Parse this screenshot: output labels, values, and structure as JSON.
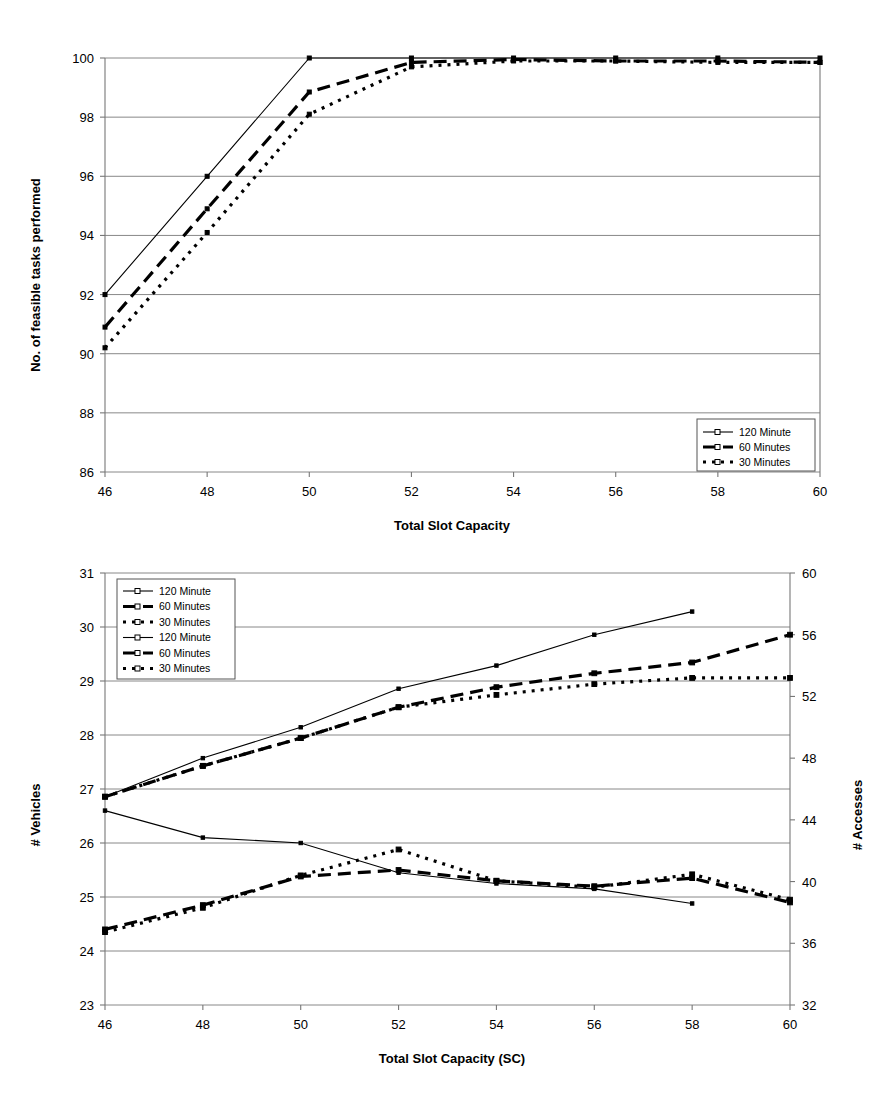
{
  "document": {
    "type": "two-panel line chart figure",
    "background_color": "#ffffff",
    "ink_color": "#000000",
    "grid_color": "#888888"
  },
  "chart_data": [
    {
      "id": "chart-top",
      "type": "line",
      "title": "",
      "xlabel": "Total Slot Capacity",
      "ylabel": "No. of feasible tasks performed",
      "xlim": [
        46,
        60
      ],
      "ylim": [
        86,
        100
      ],
      "xticks": [
        46,
        48,
        50,
        52,
        54,
        56,
        58,
        60
      ],
      "yticks": [
        86,
        88,
        90,
        92,
        94,
        96,
        98,
        100
      ],
      "grid": "horizontal",
      "legend_position": "bottom-right",
      "x": [
        46,
        48,
        50,
        52,
        54,
        56,
        58,
        60
      ],
      "series": [
        {
          "name": "120 Minute",
          "style": "solid-thin",
          "marker": "open-diamond",
          "values": [
            92.0,
            96.0,
            100.0,
            100.0,
            100.0,
            100.0,
            100.0,
            100.0
          ]
        },
        {
          "name": "60 Minutes",
          "style": "thick-dashed",
          "marker": "open-square",
          "values": [
            90.9,
            94.9,
            98.85,
            99.85,
            99.95,
            99.9,
            99.9,
            99.85
          ]
        },
        {
          "name": "30 Minutes",
          "style": "dotted",
          "marker": "open-triangle",
          "values": [
            90.2,
            94.1,
            98.1,
            99.7,
            99.9,
            99.9,
            99.85,
            99.85
          ]
        }
      ]
    },
    {
      "id": "chart-bottom",
      "type": "line",
      "title": "",
      "xlabel": "Total Slot Capacity (SC)",
      "ylabel_left": "# Vehicles",
      "ylabel_right": "# Accesses",
      "xlim": [
        46,
        60
      ],
      "ylim_left": [
        23,
        31
      ],
      "ylim_right": [
        32,
        60
      ],
      "xticks": [
        46,
        48,
        50,
        52,
        54,
        56,
        58,
        60
      ],
      "yticks_left": [
        23,
        24,
        25,
        26,
        27,
        28,
        29,
        30,
        31
      ],
      "yticks_right": [
        32,
        36,
        40,
        44,
        48,
        52,
        56,
        60
      ],
      "grid": "horizontal",
      "legend_position": "top-left",
      "x": [
        46,
        48,
        50,
        52,
        54,
        56,
        58,
        60
      ],
      "series": [
        {
          "name": "120 Minute",
          "axis": "right",
          "group": "accesses",
          "style": "solid-thin",
          "marker": "open-diamond",
          "values": [
            45.5,
            48.0,
            50.0,
            52.5,
            54.0,
            56.0,
            57.5,
            null
          ]
        },
        {
          "name": "60 Minutes",
          "axis": "right",
          "group": "accesses",
          "style": "thick-dashed",
          "marker": "open-square",
          "values": [
            45.5,
            47.5,
            49.3,
            51.3,
            52.6,
            53.5,
            54.2,
            56.0
          ]
        },
        {
          "name": "30 Minutes",
          "axis": "right",
          "group": "accesses",
          "style": "dotted",
          "marker": "open-triangle",
          "values": [
            45.5,
            47.5,
            49.3,
            51.3,
            52.1,
            52.8,
            53.2,
            53.2
          ]
        },
        {
          "name": "120 Minute",
          "axis": "left",
          "group": "vehicles",
          "style": "solid-thin",
          "marker": "open-diamond",
          "values": [
            26.6,
            26.1,
            26.0,
            25.45,
            25.25,
            25.15,
            24.88,
            null
          ]
        },
        {
          "name": "60 Minutes",
          "axis": "left",
          "group": "vehicles",
          "style": "thick-dashed",
          "marker": "open-square",
          "values": [
            24.4,
            24.85,
            25.38,
            25.5,
            25.3,
            25.2,
            25.35,
            24.9
          ]
        },
        {
          "name": "30 Minutes",
          "axis": "left",
          "group": "vehicles",
          "style": "dotted",
          "marker": "open-triangle",
          "values": [
            24.35,
            24.8,
            25.4,
            25.88,
            25.3,
            25.18,
            25.42,
            24.95
          ]
        }
      ]
    }
  ],
  "chart_top": {
    "ylabel": "No. of feasible tasks performed",
    "xlabel": "Total Slot Capacity",
    "xticks": [
      "46",
      "48",
      "50",
      "52",
      "54",
      "56",
      "58",
      "60"
    ],
    "yticks": [
      "100",
      "98",
      "96",
      "94",
      "92",
      "90",
      "88",
      "86"
    ],
    "legend": [
      {
        "label": "120 Minute"
      },
      {
        "label": "60 Minutes"
      },
      {
        "label": "30 Minutes"
      }
    ]
  },
  "chart_bottom": {
    "ylabel_left": "# Vehicles",
    "ylabel_right": "# Accesses",
    "xlabel": "Total Slot Capacity (SC)",
    "xticks": [
      "46",
      "48",
      "50",
      "52",
      "54",
      "56",
      "58",
      "60"
    ],
    "yticks_left": [
      "31",
      "30",
      "29",
      "28",
      "27",
      "26",
      "25",
      "24",
      "23"
    ],
    "yticks_right": [
      "60",
      "56",
      "52",
      "48",
      "44",
      "40",
      "36",
      "32"
    ],
    "legend": [
      {
        "label": "120 Minute"
      },
      {
        "label": "60 Minutes"
      },
      {
        "label": "30 Minutes"
      },
      {
        "label": "120 Minute"
      },
      {
        "label": "60 Minutes"
      },
      {
        "label": "30 Minutes"
      }
    ]
  }
}
